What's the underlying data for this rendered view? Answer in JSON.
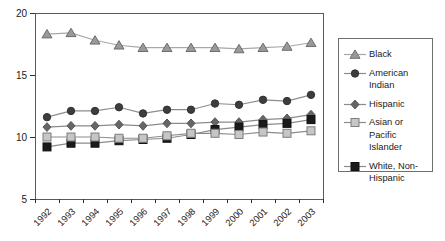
{
  "chart_data": {
    "type": "line",
    "title": "",
    "xlabel": "",
    "ylabel": "",
    "x_labels": [
      "1992",
      "1993",
      "1994",
      "1995",
      "1996",
      "1997",
      "1998",
      "1999",
      "2000",
      "2001",
      "2002",
      "2003"
    ],
    "ylim": [
      5,
      20
    ],
    "yticks": [
      5,
      10,
      15,
      20
    ],
    "grid": false,
    "legend_position": "right",
    "axis_color": "#333333",
    "plot_border_color": "#595959",
    "legend_border_color": "#6e6e6e",
    "series": [
      {
        "name": "Black",
        "marker": "triangle",
        "marker_fill": "#999999",
        "marker_stroke": "#6e6e6e",
        "line_color": "#a8a8a8",
        "values": [
          18.3,
          18.4,
          17.8,
          17.4,
          17.2,
          17.2,
          17.2,
          17.2,
          17.1,
          17.2,
          17.3,
          17.6
        ]
      },
      {
        "name": "American Indian",
        "marker": "circle",
        "marker_fill": "#3d3d3d",
        "marker_stroke": "#333333",
        "line_color": "#8c8c8c",
        "values": [
          11.6,
          12.1,
          12.1,
          12.4,
          11.9,
          12.2,
          12.2,
          12.7,
          12.6,
          13.0,
          12.9,
          13.4
        ]
      },
      {
        "name": "Hispanic",
        "marker": "diamond",
        "marker_fill": "#666666",
        "marker_stroke": "#565656",
        "line_color": "#8c8c8c",
        "values": [
          10.8,
          10.9,
          10.9,
          11.0,
          10.9,
          11.1,
          11.1,
          11.2,
          11.2,
          11.4,
          11.5,
          11.8
        ]
      },
      {
        "name": "Asian or Pacific Islander",
        "marker": "square",
        "marker_fill": "#c6c6c6",
        "marker_stroke": "#7d7d7d",
        "line_color": "#8c8c8c",
        "values": [
          10.0,
          10.0,
          10.0,
          9.9,
          9.9,
          10.1,
          10.3,
          10.3,
          10.2,
          10.4,
          10.3,
          10.5
        ]
      },
      {
        "name": "White, Non-Hispanic",
        "marker": "square",
        "marker_fill": "#1a1a1a",
        "marker_stroke": "#111111",
        "line_color": "#8c8c8c",
        "values": [
          9.2,
          9.5,
          9.5,
          9.7,
          9.8,
          9.9,
          10.2,
          10.6,
          10.8,
          11.0,
          11.1,
          11.4
        ]
      }
    ]
  }
}
